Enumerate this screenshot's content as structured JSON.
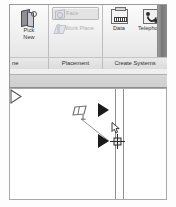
{
  "ribbon": {
    "panels": [
      {
        "title": "ne",
        "title_full": "ne",
        "buttons": [
          {
            "label_line1": "Pick",
            "label_line2": "New",
            "icon": "pick-new-icon",
            "enabled": true
          }
        ]
      },
      {
        "title": "Placement",
        "buttons": [
          {
            "label": "Face",
            "icon": "face-icon",
            "enabled": false,
            "selected": true
          },
          {
            "label": "Work Plane",
            "icon": "work-plane-icon",
            "enabled": false,
            "selected": false
          }
        ]
      },
      {
        "title": "Create Systems",
        "buttons": [
          {
            "label": "Data",
            "icon": "data-outlet-icon",
            "enabled": true
          },
          {
            "label": "Telephone",
            "icon": "telephone-icon",
            "enabled": true
          }
        ]
      }
    ]
  },
  "canvas": {
    "wall": {
      "label": "wall",
      "line_count": 2
    },
    "devices": [
      {
        "name": "device-symbol-top",
        "style": "filled-triangle",
        "fill": "#1b1b1b"
      },
      {
        "name": "device-symbol-selected",
        "style": "filled-triangle",
        "fill": "#1b1b1b"
      },
      {
        "name": "device-symbol-bottom",
        "style": "outline-triangle",
        "fill": "none"
      }
    ],
    "annotation": {
      "name": "data-outlet-symbol",
      "leader": true
    },
    "cursor": {
      "type": "crosshair-place-cursor"
    }
  },
  "colors": {
    "ribbon_bg": "#efefef",
    "panel_title_bg": "#e0e0e0",
    "disabled_text": "#b0b0b0",
    "canvas_bg": "#ffffff",
    "line": "#8d8d8d",
    "device_fill": "#1b1b1b"
  }
}
